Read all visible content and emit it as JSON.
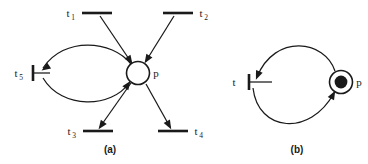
{
  "figure": {
    "background_color": "#ffffff",
    "stroke_color": "#1a1a1a",
    "token_color": "#1a1a1a",
    "place_fill_color": "#ffffff"
  },
  "diagrams": [
    {
      "caption": "(a)",
      "place": {
        "label": "p",
        "tokens": "",
        "token_count": 0,
        "marked": false
      },
      "transitions": [
        {
          "id": "t1",
          "base": "t",
          "subscript": "1",
          "position": "top-left"
        },
        {
          "id": "t2",
          "base": "t",
          "subscript": "2",
          "position": "top-right"
        },
        {
          "id": "t5",
          "base": "t",
          "subscript": "5",
          "position": "left"
        },
        {
          "id": "t3",
          "base": "t",
          "subscript": "3",
          "position": "bottom-left"
        },
        {
          "id": "t4",
          "base": "t",
          "subscript": "4",
          "position": "bottom-right"
        }
      ],
      "arcs": [
        {
          "from": "t1",
          "to": "p",
          "shape": "straight"
        },
        {
          "from": "t2",
          "to": "p",
          "shape": "straight"
        },
        {
          "from": "p",
          "to": "t5",
          "shape": "curved-upper"
        },
        {
          "from": "t5",
          "to": "p",
          "shape": "curved-lower"
        },
        {
          "from": "p",
          "to": "t3",
          "shape": "straight"
        },
        {
          "from": "p",
          "to": "t4",
          "shape": "straight"
        }
      ]
    },
    {
      "caption": "(b)",
      "place": {
        "label": "p",
        "tokens": "●",
        "token_count": 1,
        "marked": true
      },
      "transitions": [
        {
          "id": "t",
          "base": "t",
          "subscript": "",
          "position": "left"
        }
      ],
      "arcs": [
        {
          "from": "p",
          "to": "t",
          "shape": "curved-upper"
        },
        {
          "from": "t",
          "to": "p",
          "shape": "curved-lower"
        }
      ]
    }
  ],
  "labels": {
    "a_t1_base": "t",
    "a_t1_sub": "1",
    "a_t2_base": "t",
    "a_t2_sub": "2",
    "a_t3_base": "t",
    "a_t3_sub": "3",
    "a_t4_base": "t",
    "a_t4_sub": "4",
    "a_t5_base": "t",
    "a_t5_sub": "5",
    "a_place": "p",
    "a_caption": "(a)",
    "b_t_base": "t",
    "b_t_sub": "",
    "b_place": "p",
    "b_caption": "(b)"
  }
}
